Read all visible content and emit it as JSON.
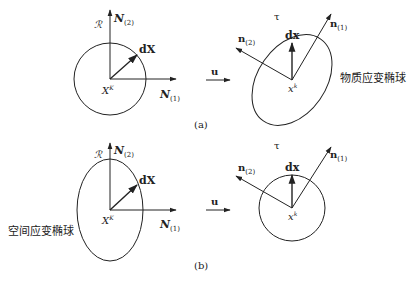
{
  "panels": {
    "a": {
      "caption": "(a)",
      "reference": {
        "region_label": "ℛ",
        "axis_vertical": "N",
        "axis_vertical_sub": "(2)",
        "axis_horizontal": "N",
        "axis_horizontal_sub": "(1)",
        "vector_label": "dX",
        "point_label": "X",
        "point_sup": "K",
        "shape": "circle"
      },
      "map_label": "u",
      "current": {
        "region_label": "τ",
        "axis_1": "n",
        "axis_1_sub": "(1)",
        "axis_2": "n",
        "axis_2_sub": "(2)",
        "vector_label": "dx",
        "point_label": "x",
        "point_sup": "k",
        "shape": "tilted ellipse",
        "annotation": "物质应变椭球"
      }
    },
    "b": {
      "caption": "(b)",
      "reference": {
        "region_label": "ℛ",
        "axis_vertical": "N",
        "axis_vertical_sub": "(2)",
        "axis_horizontal": "N",
        "axis_horizontal_sub": "(1)",
        "vector_label": "dX",
        "point_label": "X",
        "point_sup": "K",
        "shape": "vertical ellipse",
        "annotation": "空间应变椭球"
      },
      "map_label": "u",
      "current": {
        "region_label": "τ",
        "axis_1": "n",
        "axis_1_sub": "(1)",
        "axis_2": "n",
        "axis_2_sub": "(2)",
        "vector_label": "dx",
        "point_label": "x",
        "point_sup": "k",
        "shape": "circle"
      }
    }
  },
  "colors": {
    "stroke": "#222222",
    "background": "#ffffff"
  }
}
